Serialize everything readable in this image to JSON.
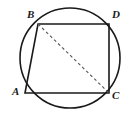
{
  "figure": {
    "background_color": "#ffffff",
    "stroke_color": "#1a1a1a",
    "dash_color": "#555555",
    "canvas": {
      "width": 136,
      "height": 116
    }
  },
  "circle": {
    "name": "circumscribed-circle",
    "center_x": 70,
    "center_y": 58,
    "radius": 50,
    "stroke_width": 1.6
  },
  "points": {
    "A": {
      "label": "A",
      "x": 25,
      "y": 93,
      "label_x": 12,
      "label_y": 86
    },
    "B": {
      "label": "B",
      "x": 38,
      "y": 24,
      "label_x": 27,
      "label_y": 9
    },
    "C": {
      "label": "C",
      "x": 109,
      "y": 93,
      "label_x": 112,
      "label_y": 90
    },
    "D": {
      "label": "D",
      "x": 109,
      "y": 24,
      "label_x": 112,
      "label_y": 9
    }
  },
  "segments": [
    {
      "name": "segment-BD",
      "from": "B",
      "to": "D",
      "style": "solid"
    },
    {
      "name": "segment-DC",
      "from": "D",
      "to": "C",
      "style": "solid"
    },
    {
      "name": "segment-CA",
      "from": "C",
      "to": "A",
      "style": "solid"
    },
    {
      "name": "segment-AB",
      "from": "A",
      "to": "B",
      "style": "solid"
    },
    {
      "name": "segment-BC-diagonal",
      "from": "B",
      "to": "C",
      "style": "dashed"
    }
  ],
  "paths": {
    "quadrilateral": "M 38 24 L 109 24 L 109 93 L 25 93 Z",
    "diagonal": "M 38 24 L 109 93"
  },
  "labels": {
    "A": "A",
    "B": "B",
    "C": "C",
    "D": "D"
  }
}
